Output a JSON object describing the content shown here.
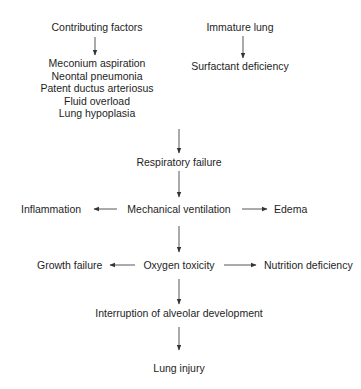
{
  "diagram": {
    "type": "flowchart",
    "nodes": {
      "contributing_factors": "Contributing factors",
      "contributing_list": [
        "Meconium aspiration",
        "Neontal pneumonia",
        "Patent ductus arteriosus",
        "Fluid overload",
        "Lung hypoplasia"
      ],
      "immature_lung": "Immature lung",
      "surfactant_deficiency": "Surfactant deficiency",
      "respiratory_failure": "Respiratory failure",
      "mechanical_ventilation": "Mechanical ventilation",
      "inflammation": "Inflammation",
      "edema": "Edema",
      "oxygen_toxicity": "Oxygen toxicity",
      "growth_failure": "Growth failure",
      "nutrition_deficiency": "Nutrition deficiency",
      "interruption": "Interruption of alveolar development",
      "lung_injury": "Lung injury"
    },
    "edges": [
      [
        "Contributing factors",
        "Contributing factors list"
      ],
      [
        "Immature lung",
        "Surfactant deficiency"
      ],
      [
        "Contributing factors list + Surfactant deficiency",
        "Respiratory failure"
      ],
      [
        "Respiratory failure",
        "Mechanical ventilation"
      ],
      [
        "Mechanical ventilation",
        "Inflammation"
      ],
      [
        "Mechanical ventilation",
        "Edema"
      ],
      [
        "Mechanical ventilation",
        "Oxygen toxicity"
      ],
      [
        "Oxygen toxicity",
        "Growth failure"
      ],
      [
        "Oxygen toxicity",
        "Nutrition deficiency"
      ],
      [
        "Oxygen toxicity",
        "Interruption of alveolar development"
      ],
      [
        "Interruption of alveolar development",
        "Lung injury"
      ]
    ],
    "colors": {
      "text": "#1e1e1e",
      "lines": "#333333",
      "background": "#ffffff"
    }
  }
}
